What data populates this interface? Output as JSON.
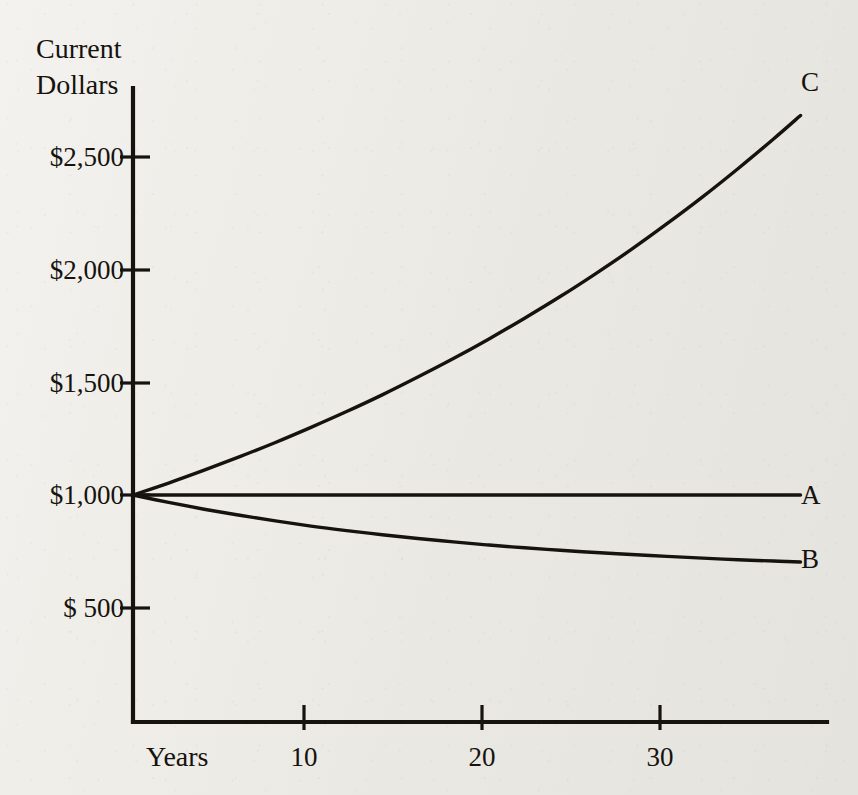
{
  "figure": {
    "background_color": "#efede7",
    "ink_color": "#16130f",
    "y_axis_title_line1": "Current",
    "y_axis_title_line2": "Dollars",
    "x_axis_title": "Years"
  },
  "chart_data": {
    "type": "line",
    "title": "",
    "subtitle": "",
    "xlabel": "Years",
    "ylabel": "Current Dollars",
    "grid": false,
    "legend_position": "inline-right-end-labels",
    "xlim": [
      0,
      39
    ],
    "ylim": [
      0,
      2800
    ],
    "x_ticks": [
      10,
      20,
      30
    ],
    "x_tick_labels": [
      "10",
      "20",
      "30"
    ],
    "y_ticks": [
      500,
      1000,
      1500,
      2000,
      2500
    ],
    "y_tick_labels": [
      "$  500",
      "$1,000",
      "$1,500",
      "$2,000",
      "$2,500"
    ],
    "annotations": [
      {
        "text": "C",
        "x": 39,
        "y": 2790
      },
      {
        "text": "A",
        "x": 39,
        "y": 1000
      },
      {
        "text": "B",
        "x": 39,
        "y": 680
      }
    ],
    "x": [
      0,
      2,
      4,
      6,
      8,
      10,
      12,
      14,
      16,
      18,
      20,
      22,
      24,
      26,
      28,
      30,
      32,
      34,
      36,
      37.5
    ],
    "series": [
      {
        "name": "C",
        "label": "C",
        "description": "Growing value — compound appreciation from $1,000",
        "values": [
          1000,
          1053,
          1110,
          1170,
          1233,
          1300,
          1370,
          1444,
          1523,
          1605,
          1692,
          1784,
          1880,
          1982,
          2089,
          2203,
          2322,
          2448,
          2580,
          2683
        ]
      },
      {
        "name": "A",
        "label": "A",
        "description": "Constant value — stays at $1,000",
        "values": [
          1000,
          1000,
          1000,
          1000,
          1000,
          1000,
          1000,
          1000,
          1000,
          1000,
          1000,
          1000,
          1000,
          1000,
          1000,
          1000,
          1000,
          1000,
          1000,
          1000
        ]
      },
      {
        "name": "B",
        "label": "B",
        "description": "Declining value — erosion from $1,000",
        "values": [
          1000,
          967,
          937,
          910,
          885,
          862,
          842,
          824,
          807,
          792,
          778,
          766,
          755,
          745,
          736,
          728,
          720,
          713,
          707,
          703
        ]
      }
    ]
  }
}
